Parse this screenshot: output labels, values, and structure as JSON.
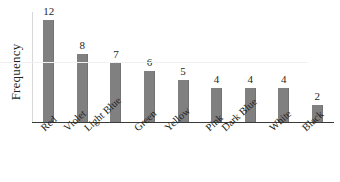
{
  "chart_data": {
    "type": "bar",
    "title": "",
    "subtitle": "",
    "xlabel": "",
    "ylabel": "Frequency",
    "categories": [
      "Red",
      "Violet",
      "Light Blue",
      "Green",
      "Yellow",
      "Pink",
      "Dark Blue",
      "White",
      "Black"
    ],
    "values": [
      12,
      8,
      7,
      6,
      5,
      4,
      4,
      4,
      2
    ],
    "value_labels": [
      "12",
      "8",
      "7",
      "6",
      "5",
      "4",
      "4",
      "4",
      "2"
    ],
    "ylim": [
      0,
      13
    ],
    "grid": false,
    "legend": false,
    "legend_position": "none",
    "annotations": [],
    "bar_color": "#808080",
    "axis_color": "#3a3a3a",
    "text_color": "#231f20",
    "background": "#ffffff"
  }
}
